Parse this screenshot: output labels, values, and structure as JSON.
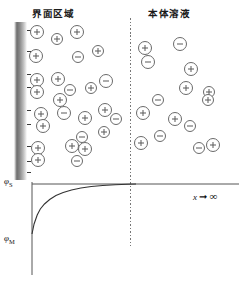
{
  "figure": {
    "title": "",
    "regions": {
      "interfacial_label": "界面区域",
      "bulk_label": "本体溶液"
    },
    "electrode": {
      "name": "metal-electrode",
      "surface_charge_sign": "−",
      "surface_charge_count": 9,
      "surface_charge_marks_y": [
        30,
        51,
        74,
        87,
        110,
        124,
        146,
        161,
        172
      ]
    },
    "divider": {
      "style": "dotted",
      "x": 130
    },
    "ions": {
      "positive_symbol": "+",
      "negative_symbol": "−",
      "interfacial": [
        {
          "x": 37,
          "y": 32,
          "r": 7,
          "sign": "+"
        },
        {
          "x": 57,
          "y": 39,
          "r": 6,
          "sign": "+"
        },
        {
          "x": 77,
          "y": 32,
          "r": 7,
          "sign": "+"
        },
        {
          "x": 36,
          "y": 56,
          "r": 7,
          "sign": "+"
        },
        {
          "x": 78,
          "y": 57,
          "r": 6,
          "sign": "−"
        },
        {
          "x": 98,
          "y": 51,
          "r": 6,
          "sign": "+"
        },
        {
          "x": 37,
          "y": 80,
          "r": 7,
          "sign": "+"
        },
        {
          "x": 58,
          "y": 79,
          "r": 7,
          "sign": "+"
        },
        {
          "x": 37,
          "y": 92,
          "r": 7,
          "sign": "+"
        },
        {
          "x": 70,
          "y": 90,
          "r": 6,
          "sign": "−"
        },
        {
          "x": 91,
          "y": 88,
          "r": 6,
          "sign": "+"
        },
        {
          "x": 106,
          "y": 81,
          "r": 7,
          "sign": "−"
        },
        {
          "x": 60,
          "y": 100,
          "r": 7,
          "sign": "+"
        },
        {
          "x": 41,
          "y": 114,
          "r": 7,
          "sign": "+"
        },
        {
          "x": 43,
          "y": 126,
          "r": 7,
          "sign": "+"
        },
        {
          "x": 64,
          "y": 113,
          "r": 7,
          "sign": "−"
        },
        {
          "x": 85,
          "y": 118,
          "r": 7,
          "sign": "+"
        },
        {
          "x": 105,
          "y": 110,
          "r": 7,
          "sign": "+"
        },
        {
          "x": 116,
          "y": 119,
          "r": 6,
          "sign": "−"
        },
        {
          "x": 104,
          "y": 132,
          "r": 6,
          "sign": "+"
        },
        {
          "x": 38,
          "y": 148,
          "r": 7,
          "sign": "+"
        },
        {
          "x": 38,
          "y": 160,
          "r": 7,
          "sign": "+"
        },
        {
          "x": 72,
          "y": 146,
          "r": 7,
          "sign": "+"
        },
        {
          "x": 85,
          "y": 149,
          "r": 7,
          "sign": "+"
        },
        {
          "x": 77,
          "y": 161,
          "r": 6,
          "sign": "−"
        },
        {
          "x": 82,
          "y": 137,
          "r": 6,
          "sign": "−"
        }
      ],
      "bulk": [
        {
          "x": 145,
          "y": 48,
          "r": 7,
          "sign": "+"
        },
        {
          "x": 180,
          "y": 44,
          "r": 7,
          "sign": "−"
        },
        {
          "x": 148,
          "y": 62,
          "r": 7,
          "sign": "−"
        },
        {
          "x": 191,
          "y": 69,
          "r": 7,
          "sign": "+"
        },
        {
          "x": 186,
          "y": 88,
          "r": 7,
          "sign": "+"
        },
        {
          "x": 209,
          "y": 92,
          "r": 6,
          "sign": "+"
        },
        {
          "x": 158,
          "y": 100,
          "r": 6,
          "sign": "−"
        },
        {
          "x": 208,
          "y": 100,
          "r": 6,
          "sign": "+"
        },
        {
          "x": 143,
          "y": 113,
          "r": 7,
          "sign": "+"
        },
        {
          "x": 175,
          "y": 119,
          "r": 7,
          "sign": "+"
        },
        {
          "x": 190,
          "y": 126,
          "r": 6,
          "sign": "−"
        },
        {
          "x": 160,
          "y": 136,
          "r": 6,
          "sign": "−"
        },
        {
          "x": 141,
          "y": 143,
          "r": 7,
          "sign": "+"
        },
        {
          "x": 199,
          "y": 148,
          "r": 6,
          "sign": "−"
        },
        {
          "x": 213,
          "y": 145,
          "r": 7,
          "sign": "+"
        }
      ]
    }
  },
  "chart_data": {
    "type": "line",
    "title": "",
    "xlabel": "x → ∞",
    "ylabel": "φ",
    "y_tick_labels": [
      "φS",
      "φM"
    ],
    "y_tick_values": [
      1.0,
      0.0
    ],
    "grid": false,
    "legend": null,
    "annotations": [
      {
        "text": "x → ∞",
        "position": "right-of-axis"
      }
    ],
    "axis": {
      "x_origin_px": 32,
      "y_top_px": 184,
      "y_bottom_px": 275,
      "x_end_px": 239
    },
    "series": [
      {
        "name": "potential-profile",
        "description": "Exponential rise of potential from φM at the metal surface to the bulk value φS",
        "x": [
          0,
          2,
          5,
          8,
          12,
          17,
          23,
          30,
          38,
          47,
          57,
          68,
          80,
          92,
          100
        ],
        "y": [
          0.0,
          0.2,
          0.38,
          0.5,
          0.6,
          0.69,
          0.77,
          0.83,
          0.88,
          0.92,
          0.95,
          0.97,
          0.985,
          0.995,
          1.0
        ]
      }
    ],
    "xlim": [
      0,
      100
    ],
    "ylim": [
      0,
      1
    ]
  }
}
